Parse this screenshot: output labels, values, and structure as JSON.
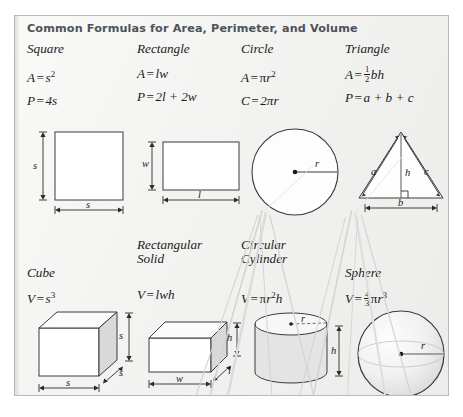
{
  "panel": {
    "title": "Common Formulas for Area, Perimeter, and Volume",
    "title_color": "#4c5358",
    "background_color": "#f2f2f0",
    "border_color": "#b9b9b7"
  },
  "row1": {
    "square": {
      "name": "Square",
      "area_lhs": "A",
      "area_eq": "=",
      "area_rhs_base": "s",
      "area_rhs_exp": "2",
      "perimeter_lhs": "P",
      "perimeter_eq": "=",
      "perimeter_rhs": "4s",
      "diagram": {
        "label_side_left": "s",
        "label_side_bottom": "s"
      }
    },
    "rectangle": {
      "name": "Rectangle",
      "area_lhs": "A",
      "area_eq": "=",
      "area_rhs": "lw",
      "perimeter_lhs": "P",
      "perimeter_eq": "=",
      "perimeter_rhs": "2l + 2w",
      "diagram": {
        "label_width": "w",
        "label_length": "l"
      }
    },
    "circle": {
      "name": "Circle",
      "area_lhs": "A",
      "area_eq": "=",
      "area_pi": "π",
      "area_r": "r",
      "area_exp": "2",
      "circumference_lhs": "C",
      "circumference_eq": "=",
      "circumference_rhs": "2πr",
      "diagram": {
        "label_radius": "r"
      }
    },
    "triangle": {
      "name": "Triangle",
      "area_lhs": "A",
      "area_eq": "=",
      "area_frac_num": "1",
      "area_frac_den": "2",
      "area_rhs": "bh",
      "perimeter_lhs": "P",
      "perimeter_eq": "=",
      "perimeter_rhs": "a + b + c",
      "diagram": {
        "label_a": "a",
        "label_c": "c",
        "label_h": "h",
        "label_b": "b"
      }
    }
  },
  "row2": {
    "cube": {
      "name": "Cube",
      "volume_lhs": "V",
      "volume_eq": "=",
      "volume_rhs_base": "s",
      "volume_rhs_exp": "3",
      "diagram": {
        "label_height": "s",
        "label_depth": "s",
        "label_width": "s"
      }
    },
    "rectangular_solid": {
      "name": "Rectangular\nSolid",
      "volume_lhs": "V",
      "volume_eq": "=",
      "volume_rhs": "lwh",
      "diagram": {
        "label_height": "h",
        "label_depth": "l",
        "label_width": "w"
      }
    },
    "circular_cylinder": {
      "name": "Circular\nCylinder",
      "volume_lhs": "V",
      "volume_eq": "=",
      "volume_pi": "π",
      "volume_r": "r",
      "volume_exp": "2",
      "volume_h": "h",
      "diagram": {
        "label_radius": "r",
        "label_height": "h"
      }
    },
    "sphere": {
      "name": "Sphere",
      "volume_lhs": "V",
      "volume_eq": "=",
      "volume_frac_num": "4",
      "volume_frac_den": "3",
      "volume_pi": "π",
      "volume_r": "r",
      "volume_exp": "3",
      "diagram": {
        "label_radius": "r"
      }
    }
  }
}
